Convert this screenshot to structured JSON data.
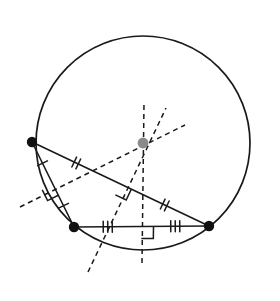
{
  "figure": {
    "background_color": "#ffffff",
    "width": 280,
    "height": 301
  },
  "style": {
    "stroke_color": "#1a1a1a",
    "center_color": "#8a8a8a",
    "vertex_color": "#111111",
    "solid_width": 1.6,
    "circle_width": 1.7,
    "dash_width": 1.5,
    "dash_pattern": "5,4",
    "tick_width": 1.5,
    "vertex_radius": 5.2,
    "center_radius": 5.4
  },
  "circle": {
    "label": "circumcircle",
    "cx": 143,
    "cy": 143,
    "r": 107
  },
  "circumcenter": {
    "label": "circumcenter",
    "x": 143,
    "y": 143
  },
  "vertices": [
    {
      "name": "A",
      "position": "top-left",
      "x": 32,
      "y": 142
    },
    {
      "name": "B",
      "position": "bottom-left",
      "x": 74,
      "y": 227
    },
    {
      "name": "C",
      "position": "right",
      "x": 209,
      "y": 226
    }
  ],
  "sides": [
    {
      "name": "AB",
      "from": "A",
      "to": "B",
      "x1": 32,
      "y1": 142,
      "x2": 74,
      "y2": 227,
      "tick_count": 1,
      "midpoint": {
        "x": 53,
        "y": 184.5
      }
    },
    {
      "name": "AC",
      "from": "A",
      "to": "C",
      "x1": 32,
      "y1": 142,
      "x2": 209,
      "y2": 226,
      "tick_count": 2,
      "midpoint": {
        "x": 120.5,
        "y": 184
      }
    },
    {
      "name": "BC",
      "from": "B",
      "to": "C",
      "x1": 74,
      "y1": 227,
      "x2": 209,
      "y2": 226,
      "tick_count": 3,
      "midpoint": {
        "x": 141.5,
        "y": 226.5
      }
    }
  ],
  "bisectors": [
    {
      "name": "bisector-of-AB",
      "chord": "AB",
      "x1": 20,
      "y1": 207,
      "x2": 185,
      "y2": 125,
      "right_angle_at": {
        "x": 53,
        "y": 184.5
      }
    },
    {
      "name": "bisector-of-AC",
      "chord": "AC",
      "x1": 88,
      "y1": 272,
      "x2": 166,
      "y2": 108,
      "right_angle_at": {
        "x": 120.5,
        "y": 184
      }
    },
    {
      "name": "bisector-of-BC",
      "chord": "BC",
      "x1": 142,
      "y1": 263,
      "x2": 144,
      "y2": 103,
      "right_angle_at": {
        "x": 141.5,
        "y": 226.5
      }
    }
  ],
  "tick_marks": {
    "single_label": "one-tick",
    "double_label": "two-ticks",
    "triple_label": "three-ticks",
    "length": 11,
    "spacing": 4.5
  },
  "right_angle_marks": {
    "label": "right-angle-square",
    "size": 12,
    "count": 3
  }
}
